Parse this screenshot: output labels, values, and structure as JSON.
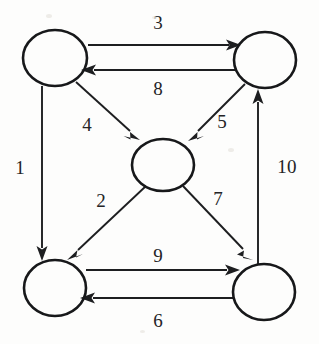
{
  "diagram": {
    "stroke_color": "#1d1e20",
    "node_stroke_color": "#17181a",
    "background_color": "#fdfdfc",
    "nodes": [
      {
        "id": "top-left",
        "label": "",
        "cx": 55,
        "cy": 58,
        "rx": 32,
        "ry": 28
      },
      {
        "id": "top-right",
        "label": "",
        "cx": 265,
        "cy": 60,
        "rx": 31,
        "ry": 28
      },
      {
        "id": "center",
        "label": "",
        "cx": 163,
        "cy": 165,
        "rx": 31,
        "ry": 26
      },
      {
        "id": "bottom-left",
        "label": "",
        "cx": 55,
        "cy": 288,
        "rx": 31,
        "ry": 28
      },
      {
        "id": "bottom-right",
        "label": "",
        "cx": 264,
        "cy": 292,
        "rx": 31,
        "ry": 28
      }
    ],
    "edges": [
      {
        "id": "edge-1",
        "label": "1",
        "from": "top-left",
        "to": "bottom-left",
        "label_x": 20,
        "label_y": 167
      },
      {
        "id": "edge-2",
        "label": "2",
        "from": "center",
        "to": "bottom-left",
        "label_x": 101,
        "label_y": 200
      },
      {
        "id": "edge-3",
        "label": "3",
        "from": "top-left",
        "to": "top-right",
        "label_x": 158,
        "label_y": 22
      },
      {
        "id": "edge-4",
        "label": "4",
        "from": "top-left",
        "to": "center",
        "label_x": 87,
        "label_y": 124
      },
      {
        "id": "edge-5",
        "label": "5",
        "from": "top-right",
        "to": "center",
        "label_x": 222,
        "label_y": 121
      },
      {
        "id": "edge-6",
        "label": "6",
        "from": "bottom-right",
        "to": "bottom-left",
        "label_x": 158,
        "label_y": 320
      },
      {
        "id": "edge-7",
        "label": "7",
        "from": "center",
        "to": "bottom-right",
        "label_x": 218,
        "label_y": 198
      },
      {
        "id": "edge-8",
        "label": "8",
        "from": "top-right",
        "to": "top-left",
        "label_x": 158,
        "label_y": 88
      },
      {
        "id": "edge-9",
        "label": "9",
        "from": "bottom-left",
        "to": "bottom-right",
        "label_x": 158,
        "label_y": 255
      },
      {
        "id": "edge-10",
        "label": "10",
        "from": "bottom-right",
        "to": "top-right",
        "label_x": 287,
        "label_y": 166
      }
    ]
  }
}
